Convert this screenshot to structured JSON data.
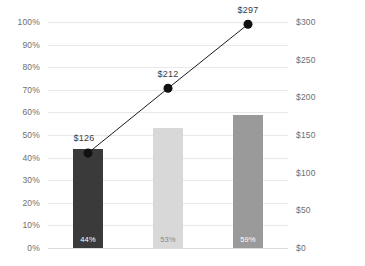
{
  "chart_data": {
    "type": "bar",
    "title": "",
    "subtitle": "",
    "xlabel": "",
    "ylabel": "",
    "grid": true,
    "legend": "none",
    "categories": [
      "1",
      "2",
      "3"
    ],
    "axes": {
      "left": {
        "label": "",
        "ticks": [
          "0%",
          "10%",
          "20%",
          "30%",
          "40%",
          "50%",
          "60%",
          "70%",
          "80%",
          "90%",
          "100%"
        ],
        "values": [
          0,
          10,
          20,
          30,
          40,
          50,
          60,
          70,
          80,
          90,
          100
        ],
        "min": 0,
        "max": 100
      },
      "right": {
        "label": "",
        "ticks": [
          "$0",
          "$50",
          "$100",
          "$150",
          "$200",
          "$250",
          "$300"
        ],
        "values": [
          0,
          50,
          100,
          150,
          200,
          250,
          300
        ],
        "min": 0,
        "max": 300
      }
    },
    "series": [
      {
        "name": "Percentage",
        "type": "bar",
        "axis": "left",
        "values": [
          44,
          53,
          59
        ],
        "labels": [
          "44%",
          "53%",
          "59%"
        ],
        "colors": [
          "#3a3a3a",
          "#d8d8d8",
          "#9a9a9a"
        ]
      },
      {
        "name": "Amount",
        "type": "line",
        "axis": "right",
        "values": [
          126,
          212,
          297
        ],
        "labels": [
          "$126",
          "$212",
          "$297"
        ],
        "color": "#1a1a1a"
      }
    ]
  },
  "colors": {
    "background": "#ffffff",
    "gridline": "#e8e8e8",
    "baseline": "#dcdcdc",
    "axis_text": "#6e6e6e",
    "label_text": "#3a3a3a",
    "bar_1": "#3a3a3a",
    "bar_2": "#d8d8d8",
    "bar_3": "#9a9a9a",
    "line": "#1a1a1a",
    "marker": "#111111",
    "bar_label_text": "#ffffff"
  }
}
